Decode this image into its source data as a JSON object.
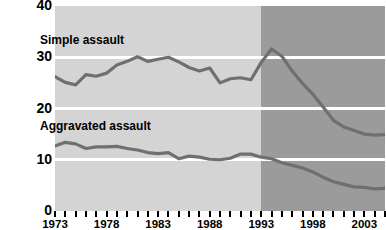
{
  "chart_data": {
    "type": "line",
    "title": "",
    "xlabel": "",
    "ylabel": "",
    "xlim": [
      1973,
      2005
    ],
    "ylim": [
      0,
      40
    ],
    "grid": true,
    "gridlines_y": [
      10,
      20,
      30
    ],
    "legend_position": "inline",
    "y_ticks": [
      "40",
      "30",
      "20",
      "10",
      "0"
    ],
    "y_tick_values": [
      40,
      30,
      20,
      10,
      0
    ],
    "x_tick_years": [
      1973,
      1974,
      1975,
      1976,
      1977,
      1978,
      1979,
      1980,
      1981,
      1982,
      1983,
      1984,
      1985,
      1986,
      1987,
      1988,
      1989,
      1990,
      1991,
      1992,
      1993,
      1994,
      1995,
      1996,
      1997,
      1998,
      1999,
      2000,
      2001,
      2002,
      2003,
      2004,
      2005
    ],
    "x_tick_labels": [
      {
        "year": 1973,
        "label": "1973"
      },
      {
        "year": 1978,
        "label": "1978"
      },
      {
        "year": 1983,
        "label": "1983"
      },
      {
        "year": 1988,
        "label": "1988"
      },
      {
        "year": 1993,
        "label": "1993"
      },
      {
        "year": 1998,
        "label": "1998"
      },
      {
        "year": 2003,
        "label": "2003"
      }
    ],
    "shading": {
      "early_band_color": "#d4d4d4",
      "late_band_color": "#9b9b9b",
      "late_band_start_year": 1993
    },
    "series_color": "#6f6f6f",
    "series": [
      {
        "name": "Simple assault",
        "label": "Simple assault",
        "x": [
          1973,
          1974,
          1975,
          1976,
          1977,
          1978,
          1979,
          1980,
          1981,
          1982,
          1983,
          1984,
          1985,
          1986,
          1987,
          1988,
          1989,
          1990,
          1991,
          1992,
          1993,
          1994,
          1995,
          1996,
          1997,
          1998,
          1999,
          2000,
          2001,
          2002,
          2003,
          2004,
          2005
        ],
        "values": [
          26.2,
          25.1,
          24.6,
          26.6,
          26.3,
          26.9,
          28.5,
          29.2,
          30.1,
          29.2,
          29.6,
          30.0,
          29.1,
          28.0,
          27.3,
          27.9,
          25.0,
          25.8,
          26.0,
          25.6,
          29.0,
          31.6,
          30.2,
          27.3,
          24.9,
          22.8,
          20.3,
          17.7,
          16.4,
          15.7,
          15.0,
          14.8,
          14.9
        ]
      },
      {
        "name": "Aggravated assault",
        "label": "Aggravated assault",
        "x": [
          1973,
          1974,
          1975,
          1976,
          1977,
          1978,
          1979,
          1980,
          1981,
          1982,
          1983,
          1984,
          1985,
          1986,
          1987,
          1988,
          1989,
          1990,
          1991,
          1992,
          1993,
          1994,
          1995,
          1996,
          1997,
          1998,
          1999,
          2000,
          2001,
          2002,
          2003,
          2004,
          2005
        ],
        "values": [
          12.7,
          13.4,
          13.1,
          12.2,
          12.5,
          12.5,
          12.6,
          12.2,
          11.9,
          11.4,
          11.2,
          11.4,
          10.2,
          10.7,
          10.5,
          10.1,
          10.0,
          10.3,
          11.1,
          11.1,
          10.5,
          10.2,
          9.4,
          8.9,
          8.4,
          7.6,
          6.6,
          5.7,
          5.2,
          4.7,
          4.6,
          4.3,
          4.4
        ]
      }
    ]
  }
}
